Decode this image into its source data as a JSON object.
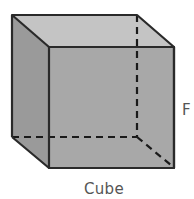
{
  "diagram": {
    "caption": "Cube",
    "side_label": "F",
    "colors": {
      "top_face": "#c4c4c4",
      "left_face": "#9a9a9a",
      "front_face": "#a8a8a8",
      "edge": "#2a2a2a",
      "label": "#555555"
    }
  }
}
